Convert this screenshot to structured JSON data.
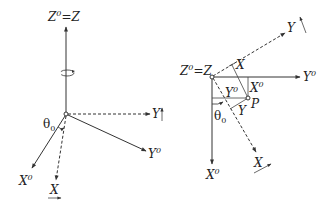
{
  "left_diagram": {
    "z_label": "Z",
    "z_label_sup": "0",
    "z_label_eq": "=Z",
    "y_label": "Y",
    "y0_label": "Y",
    "y0_sup": "0",
    "x0_label": "X",
    "x0_sup": "0",
    "x_label": "X",
    "theta_label": "θ",
    "theta_sub": "0"
  },
  "right_diagram": {
    "z_label": "Z",
    "z_label_sup": "0",
    "z_label_eq": "=Z",
    "y_label": "Y",
    "y0_label": "Y",
    "y0_sup": "0",
    "x0_label": "X",
    "x0_sup": "0",
    "x_label": "X",
    "inner_x_label": "X",
    "inner_x0_label": "X",
    "inner_x0_sup": "0",
    "inner_y0_label": "Y",
    "inner_y0_sup": "0",
    "inner_y_label": "Y",
    "p_label": "P",
    "theta_label": "θ",
    "theta_sub": "0"
  },
  "colors": {
    "line": "#333333",
    "text": "#222222",
    "background": "#ffffff"
  }
}
